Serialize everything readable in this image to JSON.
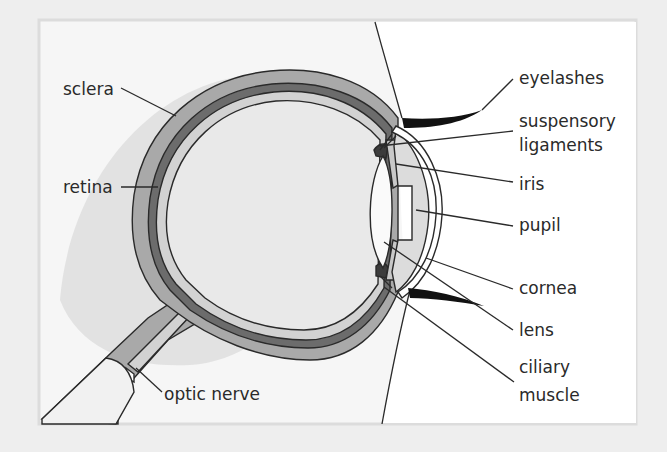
{
  "diagram": {
    "labels": {
      "sclera": "sclera",
      "retina": "retina",
      "optic_nerve": "optic nerve",
      "eyelashes": "eyelashes",
      "suspensory_ligaments_1": "suspensory",
      "suspensory_ligaments_2": "ligaments",
      "iris": "iris",
      "pupil": "pupil",
      "cornea": "cornea",
      "lens": "lens",
      "ciliary_muscle_1": "ciliary",
      "ciliary_muscle_2": "muscle"
    },
    "colors": {
      "page_background": "#eeeeee",
      "panel_background": "#f6f6f6",
      "panel_border": "#dddddd",
      "eyelid_area": "#ffffff",
      "shadow": "#dedede",
      "sclera": "#a9a9a9",
      "choroid": "#6c6c6c",
      "retina": "#d2d2d2",
      "vitreous": "#e9e9e9",
      "lens": "#fafafa",
      "iris": "#c8c8c8",
      "ciliary": "#3c3c3c",
      "eyelash": "#111111",
      "outline": "#2a2a2a"
    }
  }
}
